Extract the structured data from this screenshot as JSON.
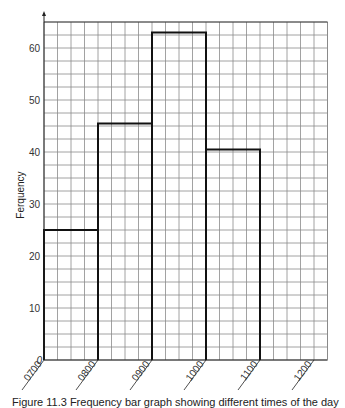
{
  "chart_data": {
    "type": "bar",
    "subtype": "histogram",
    "title": "",
    "xlabel": "",
    "ylabel": "Ferquency",
    "x_tick_labels": [
      "0700",
      "0800",
      "0900",
      "1000",
      "1100",
      "1200"
    ],
    "y_tick_labels": [
      "0",
      "10",
      "20",
      "30",
      "40",
      "50",
      "60"
    ],
    "categories": [
      "0700-0800",
      "0800-0900",
      "0900-1000",
      "1000-1100"
    ],
    "bins": [
      [
        700,
        800
      ],
      [
        800,
        900
      ],
      [
        900,
        1000
      ],
      [
        1000,
        1100
      ]
    ],
    "values": [
      25,
      45.5,
      63,
      40.5
    ],
    "ylim": [
      0,
      65
    ],
    "xlim": [
      "0700",
      "1215"
    ],
    "grid": true,
    "grid_minor_x": "15 min",
    "grid_minor_y": 2.5,
    "legend": null
  },
  "caption": {
    "text": "Figure 11.3  Frequency bar graph showing different times of the day"
  },
  "colors": {
    "grid": "#8a8a8a",
    "axis": "#222222",
    "bars": "#111111",
    "background": "#ffffff"
  }
}
